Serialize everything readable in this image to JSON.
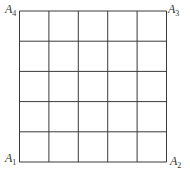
{
  "figure": {
    "type": "square-grid",
    "rows": 5,
    "cols": 5,
    "line_color": "#3a3a3a",
    "grid_left": 19.5,
    "grid_top": 11,
    "grid_right": 166.5,
    "grid_bottom": 162,
    "corners": {
      "bottom_left": {
        "letter": "A",
        "index": "1"
      },
      "bottom_right": {
        "letter": "A",
        "index": "2"
      },
      "top_right": {
        "letter": "A",
        "index": "3"
      },
      "top_left": {
        "letter": "A",
        "index": "4"
      }
    }
  }
}
